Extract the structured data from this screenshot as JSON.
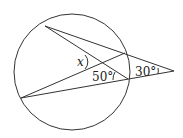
{
  "diagram": {
    "type": "circle-secant-angles",
    "labels": {
      "x": "x",
      "angle_inner": "50°",
      "angle_outer": "30°"
    },
    "colors": {
      "stroke": "#333333",
      "background": "#ffffff"
    }
  }
}
